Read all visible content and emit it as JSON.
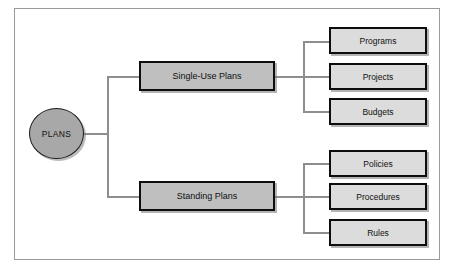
{
  "diagram": {
    "root": {
      "label": "PLANS",
      "shape": "circle",
      "fill": "#a8a8a8"
    },
    "branches": [
      {
        "label": "Single-Use Plans",
        "fill": "#bfbfbf",
        "children": [
          {
            "label": "Programs",
            "fill": "#dcdcdc"
          },
          {
            "label": "Projects",
            "fill": "#dcdcdc"
          },
          {
            "label": "Budgets",
            "fill": "#dcdcdc"
          }
        ]
      },
      {
        "label": "Standing Plans",
        "fill": "#bfbfbf",
        "children": [
          {
            "label": "Policies",
            "fill": "#dcdcdc"
          },
          {
            "label": "Procedures",
            "fill": "#dcdcdc"
          },
          {
            "label": "Rules",
            "fill": "#dcdcdc"
          }
        ]
      }
    ],
    "colors": {
      "frame_border": "#9a9a9a",
      "connector": "#8e8e8e",
      "node_border": "#0d0d0d",
      "canvas": "#ffffff"
    }
  }
}
